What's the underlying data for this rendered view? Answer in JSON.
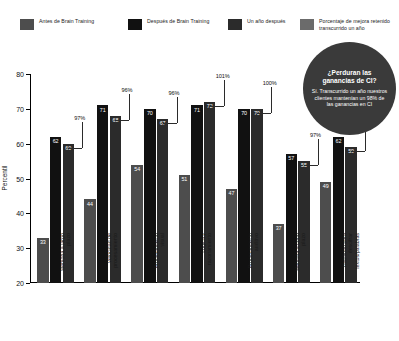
{
  "legend": {
    "items": [
      {
        "label": "Antes de Brain Training",
        "color": "#4d4d4d"
      },
      {
        "label": "Después de Brain Training",
        "color": "#111111"
      },
      {
        "label": "Un año después",
        "color": "#2b2b2b"
      },
      {
        "label": "Porcentaje de mejora retenido\ntranscurrido un año",
        "color": "#6b6b6b"
      }
    ]
  },
  "badge": {
    "title": "¿Perduran las ganancias de CI?",
    "body": "Sí. Transcurrido un año nuestros clientes mantenían un 98% de las ganancias en CI"
  },
  "chart_data": {
    "type": "bar",
    "title": "",
    "xlabel": "",
    "ylabel": "Percentil",
    "ylim": [
      20,
      80
    ],
    "yticks": [
      20,
      30,
      40,
      50,
      60,
      70,
      80
    ],
    "grid": false,
    "legend_position": "top",
    "categories": [
      "Memoria a largo plazo",
      "Velocidad de procesamiento",
      "Procesamiento visual",
      "Lógica y razonamiento",
      "Procesamiento auditivo",
      "Memoria a corto plazo",
      "Habilidad para descifrar textos/palabras"
    ],
    "series": [
      {
        "name": "Antes de Brain Training",
        "color": "#4d4d4d",
        "values": [
          33,
          44,
          54,
          51,
          47,
          37,
          49
        ]
      },
      {
        "name": "Después de Brain Training",
        "color": "#111111",
        "values": [
          62,
          71,
          70,
          71,
          70,
          57,
          62
        ]
      },
      {
        "name": "Un año después",
        "color": "#2b2b2b",
        "values": [
          60,
          68,
          67,
          72,
          70,
          55,
          59
        ]
      }
    ],
    "annotations": {
      "name": "Porcentaje de mejora retenido transcurrido un año",
      "values": [
        "97%",
        "96%",
        "96%",
        "101%",
        "100%",
        "97%",
        "95%"
      ]
    }
  }
}
